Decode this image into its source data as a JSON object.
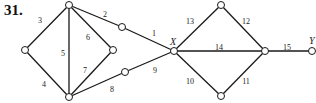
{
  "problem_number": "31.",
  "colors": {
    "edge": "#1a1a1a",
    "node_fill": "#ffffff",
    "node_stroke": "#1a1a1a",
    "text": "#222222"
  },
  "nodes": [
    {
      "id": "n_top",
      "x": 69,
      "y": 5,
      "label": ""
    },
    {
      "id": "n_left",
      "x": 25,
      "y": 50,
      "label": ""
    },
    {
      "id": "n_bottom",
      "x": 69,
      "y": 97,
      "label": ""
    },
    {
      "id": "n_inner",
      "x": 113,
      "y": 50,
      "label": ""
    },
    {
      "id": "n_upper_mid",
      "x": 122,
      "y": 27,
      "label": ""
    },
    {
      "id": "n_lower_mid",
      "x": 125,
      "y": 72,
      "label": ""
    },
    {
      "id": "X",
      "x": 174,
      "y": 51,
      "label": "X",
      "lx": 170,
      "ly": 45
    },
    {
      "id": "n_rtop",
      "x": 221,
      "y": 5,
      "label": ""
    },
    {
      "id": "n_right",
      "x": 265,
      "y": 51,
      "label": ""
    },
    {
      "id": "n_rbottom",
      "x": 221,
      "y": 96,
      "label": ""
    },
    {
      "id": "Y",
      "x": 312,
      "y": 51,
      "label": "Y",
      "lx": 309,
      "ly": 44
    }
  ],
  "edges": [
    {
      "label": "1",
      "from": "n_upper_mid",
      "to": "X",
      "lx": 154,
      "ly": 36
    },
    {
      "label": "2",
      "from": "n_top",
      "to": "n_upper_mid",
      "lx": 105,
      "ly": 17
    },
    {
      "label": "3",
      "from": "n_top",
      "to": "n_left",
      "lx": 40,
      "ly": 23
    },
    {
      "label": "4",
      "from": "n_left",
      "to": "n_bottom",
      "lx": 44,
      "ly": 87
    },
    {
      "label": "5",
      "from": "n_top",
      "to": "n_bottom",
      "lx": 63,
      "ly": 56
    },
    {
      "label": "6",
      "from": "n_top",
      "to": "n_inner",
      "lx": 88,
      "ly": 40
    },
    {
      "label": "7",
      "from": "n_inner",
      "to": "n_bottom",
      "lx": 85,
      "ly": 73
    },
    {
      "label": "8",
      "from": "n_bottom",
      "to": "n_lower_mid",
      "lx": 112,
      "ly": 92
    },
    {
      "label": "9",
      "from": "n_lower_mid",
      "to": "X",
      "lx": 155,
      "ly": 73
    },
    {
      "label": "10",
      "from": "X",
      "to": "n_rbottom",
      "lx": 190,
      "ly": 84
    },
    {
      "label": "11",
      "from": "n_rbottom",
      "to": "n_right",
      "lx": 246,
      "ly": 84
    },
    {
      "label": "12",
      "from": "n_rtop",
      "to": "n_right",
      "lx": 246,
      "ly": 24
    },
    {
      "label": "13",
      "from": "X",
      "to": "n_rtop",
      "lx": 190,
      "ly": 24
    },
    {
      "label": "14",
      "from": "X",
      "to": "n_right",
      "lx": 219,
      "ly": 50
    },
    {
      "label": "15",
      "from": "n_right",
      "to": "Y",
      "lx": 287,
      "ly": 50
    }
  ]
}
